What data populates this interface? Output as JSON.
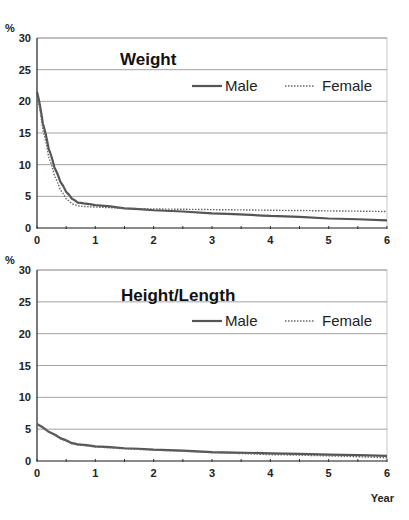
{
  "chart_data": [
    {
      "type": "line",
      "title": "Weight",
      "ylabel": "%",
      "xlabel": "",
      "ylim": [
        0,
        30
      ],
      "xlim": [
        0,
        6
      ],
      "yticks": [
        "0",
        "5",
        "10",
        "15",
        "20",
        "25",
        "30"
      ],
      "xticks": [
        "0",
        "1",
        "2",
        "3",
        "4",
        "5",
        "6"
      ],
      "grid": true,
      "legend_position": "upper right",
      "x": [
        0,
        0.1,
        0.2,
        0.3,
        0.4,
        0.5,
        0.6,
        0.7,
        0.8,
        1,
        1.5,
        2,
        3,
        4,
        5,
        6
      ],
      "series": [
        {
          "name": "Male",
          "style": "solid",
          "values": [
            21.5,
            16.5,
            12.5,
            9.5,
            7.3,
            5.7,
            4.6,
            4.0,
            3.9,
            3.6,
            3.1,
            2.8,
            2.3,
            1.9,
            1.5,
            1.2
          ]
        },
        {
          "name": "Female",
          "style": "dotted",
          "values": [
            21.0,
            15.5,
            11.2,
            8.2,
            6.0,
            4.6,
            3.8,
            3.5,
            3.4,
            3.3,
            3.1,
            3.0,
            2.9,
            2.8,
            2.7,
            2.6
          ]
        }
      ]
    },
    {
      "type": "line",
      "title": "Height/Length",
      "ylabel": "%",
      "xlabel": "Year",
      "ylim": [
        0,
        30
      ],
      "xlim": [
        0,
        6
      ],
      "yticks": [
        "0",
        "5",
        "10",
        "15",
        "20",
        "25",
        "30"
      ],
      "xticks": [
        "0",
        "1",
        "2",
        "3",
        "4",
        "5",
        "6"
      ],
      "grid": true,
      "legend_position": "upper right",
      "x": [
        0,
        0.2,
        0.4,
        0.6,
        0.7,
        1,
        1.5,
        2,
        3,
        4,
        5,
        6
      ],
      "series": [
        {
          "name": "Male",
          "style": "solid",
          "values": [
            5.8,
            4.6,
            3.6,
            2.8,
            2.6,
            2.3,
            2.0,
            1.8,
            1.4,
            1.2,
            1.0,
            0.8
          ]
        },
        {
          "name": "Female",
          "style": "dotted",
          "values": [
            5.7,
            4.5,
            3.5,
            2.7,
            2.5,
            2.2,
            1.9,
            1.7,
            1.3,
            1.0,
            0.8,
            0.5
          ]
        }
      ]
    }
  ],
  "charts": [
    {
      "title": "Weight",
      "unit": "%",
      "legend": {
        "male": "Male",
        "female": "Female"
      }
    },
    {
      "title": "Height/Length",
      "unit": "%",
      "legend": {
        "male": "Male",
        "female": "Female"
      },
      "x_axis_label": "Year"
    }
  ],
  "colors": {
    "male_line": "#555555",
    "female_line": "#666666",
    "grid": "#8c8c8c"
  }
}
